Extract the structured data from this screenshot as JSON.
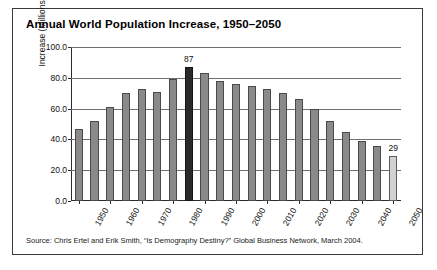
{
  "figure": {
    "title": "Annual World Population Increase, 1950–2050",
    "source": "Source: Chris Ertel and Erik Smith, “Is Demography Destiny?” Global Business Network, March 2004.",
    "border_color": "#3a3a3a",
    "background": "#ffffff"
  },
  "colors": {
    "bar_default": "#8a8a8a",
    "bar_highlight": "#2a2a2a",
    "bar_light": "#d2d2d2",
    "bar_edge": "#4a4a4a",
    "gridline": "#6f6f6f",
    "axis": "#2c2c2c",
    "text": "#111111"
  },
  "chart_data": {
    "type": "bar",
    "title": "Annual World Population Increase, 1950–2050",
    "xlabel": "",
    "ylabel": "Increase (Millions)",
    "ylim": [
      0.0,
      100.0
    ],
    "yticks": [
      "0.0",
      "20.0",
      "40.0",
      "60.0",
      "80.0",
      "100.0"
    ],
    "ytick_values": [
      0.0,
      20.0,
      40.0,
      60.0,
      80.0,
      100.0
    ],
    "xtick_labels": [
      "1950",
      "1960",
      "1970",
      "1980",
      "1990",
      "2000",
      "2010",
      "2020",
      "2030",
      "2040",
      "2050"
    ],
    "grid": true,
    "legend": false,
    "categories": [
      "1950",
      "1955",
      "1960",
      "1965",
      "1970",
      "1975",
      "1980",
      "1985",
      "1990",
      "1995",
      "2000",
      "2005",
      "2010",
      "2015",
      "2020",
      "2025",
      "2030",
      "2035",
      "2040",
      "2045",
      "2050"
    ],
    "values": [
      47,
      52,
      61,
      70,
      73,
      71,
      79,
      87,
      83,
      78,
      76,
      75,
      73,
      70,
      66,
      60,
      52,
      45,
      39,
      36,
      29
    ],
    "bar_styles": [
      "default",
      "default",
      "default",
      "default",
      "default",
      "default",
      "default",
      "highlight",
      "default",
      "default",
      "default",
      "default",
      "default",
      "default",
      "default",
      "default",
      "default",
      "default",
      "default",
      "default",
      "light"
    ],
    "annotations": [
      {
        "category": "1985",
        "label": "87",
        "value": 87
      },
      {
        "category": "2050",
        "label": "29",
        "value": 29
      }
    ]
  }
}
